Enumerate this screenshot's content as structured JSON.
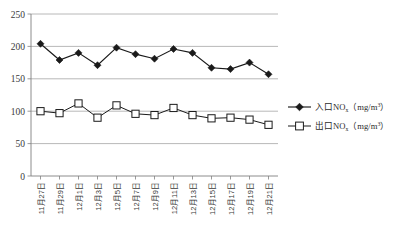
{
  "chart_data": {
    "type": "line",
    "title": "",
    "xlabel": "",
    "ylabel": "",
    "ylim": [
      0,
      250
    ],
    "yticks": [
      0,
      50,
      100,
      150,
      200,
      250
    ],
    "grid": true,
    "legend_position": "right",
    "categories": [
      "11月27日",
      "11月29日",
      "12月1日",
      "12月3日",
      "12月5日",
      "12月7日",
      "12月9日",
      "12月11日",
      "12月13日",
      "12月15日",
      "12月17日",
      "12月19日",
      "12月21日"
    ],
    "series": [
      {
        "name": "入口NOx（mg/m³）",
        "name_base": "入口NO",
        "name_sub": "x",
        "name_unit": "（mg/m³）",
        "marker": "filled-diamond",
        "color": "#1a1a1a",
        "values": [
          204,
          179,
          190,
          171,
          198,
          188,
          181,
          196,
          190,
          167,
          165,
          175,
          157
        ]
      },
      {
        "name": "出口NOx（mg/m³）",
        "name_base": "出口NO",
        "name_sub": "x",
        "name_unit": "（mg/m³）",
        "marker": "open-square",
        "color": "#1a1a1a",
        "values": [
          100,
          97,
          112,
          90,
          109,
          96,
          94,
          105,
          94,
          89,
          90,
          87,
          79
        ]
      }
    ]
  },
  "axis": {
    "y_labels": [
      "250",
      "200",
      "150",
      "100",
      "50",
      "0"
    ]
  },
  "legend": {
    "items": [
      {
        "base": "入口NO",
        "sub": "x",
        "unit": "（mg/m",
        "sup": "3",
        "tail": "）",
        "marker": "filled-diamond"
      },
      {
        "base": "出口NO",
        "sub": "x",
        "unit": "（mg/m",
        "sup": "3",
        "tail": "）",
        "marker": "open-square"
      }
    ]
  }
}
